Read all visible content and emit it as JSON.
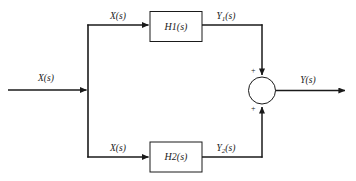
{
  "diagram": {
    "type": "control-system-block-diagram",
    "background_color": "#ffffff",
    "line_color": "#1a1a1a",
    "input": {
      "label_text": "X(s)",
      "label_var": "X",
      "label_arg": "(s)"
    },
    "branch_top": {
      "signal_label_var": "X",
      "signal_label_arg": "(s)",
      "block_name": "H",
      "block_subscript": "1",
      "block_arg": "(s)",
      "output_label_var": "Y",
      "output_label_subscript": "1",
      "output_label_arg": "(s)",
      "sign": "+"
    },
    "branch_bottom": {
      "signal_label_var": "X",
      "signal_label_arg": "(s)",
      "block_name": "H",
      "block_subscript": "2",
      "block_arg": "(s)",
      "output_label_var": "Y",
      "output_label_subscript": "2",
      "output_label_arg": "(s)",
      "sign": "+"
    },
    "summing_junction": {
      "shape": "circle",
      "top_sign": "+",
      "bottom_sign": "+"
    },
    "output": {
      "label_var": "Y",
      "label_arg": "(s)"
    }
  }
}
